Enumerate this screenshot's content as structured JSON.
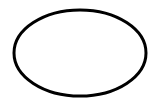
{
  "diagram": {
    "background": "#ffffff",
    "shapes": [
      {
        "type": "ellipse",
        "cx": 80,
        "cy": 53,
        "rx": 66,
        "ry": 43,
        "stroke": "#000000",
        "stroke_width": 3,
        "fill": "none"
      }
    ]
  }
}
